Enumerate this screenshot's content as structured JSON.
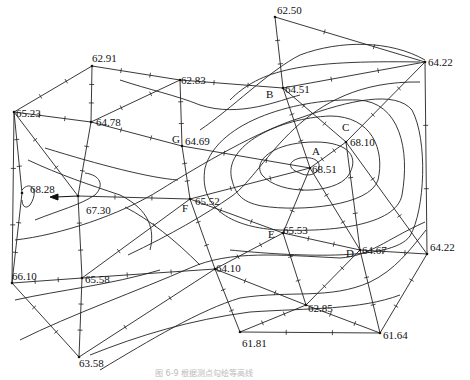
{
  "diagram": {
    "type": "contour-interpolation-map",
    "caption": "图 6-9  根据测点勾绘等高线",
    "points": [
      {
        "id": "p1",
        "label": "62.50",
        "x": 275,
        "y": 17,
        "lx": 277,
        "ly": 14
      },
      {
        "id": "p2",
        "label": "64.22",
        "x": 425,
        "y": 62,
        "lx": 428,
        "ly": 66
      },
      {
        "id": "p3",
        "label": "62.91",
        "x": 92,
        "y": 66,
        "lx": 92,
        "ly": 62
      },
      {
        "id": "p4",
        "label": "62.83",
        "x": 180,
        "y": 80,
        "lx": 181,
        "ly": 84
      },
      {
        "id": "p5",
        "label": "64.51",
        "x": 283,
        "y": 88,
        "lx": 285,
        "ly": 93
      },
      {
        "id": "p6",
        "label": "65.23",
        "x": 14,
        "y": 112,
        "lx": 16,
        "ly": 117
      },
      {
        "id": "p7",
        "label": "64.78",
        "x": 91,
        "y": 122,
        "lx": 96,
        "ly": 126
      },
      {
        "id": "p8",
        "label": "64.69",
        "x": 182,
        "y": 146,
        "lx": 185,
        "ly": 145
      },
      {
        "id": "p9",
        "label": "68.10",
        "x": 346,
        "y": 142,
        "lx": 350,
        "ly": 146
      },
      {
        "id": "p10",
        "label": "68.51",
        "x": 310,
        "y": 168,
        "lx": 312,
        "ly": 173
      },
      {
        "id": "p11",
        "label": "68.28",
        "x": 22,
        "y": 193,
        "lx": 30,
        "ly": 193
      },
      {
        "id": "p12",
        "label": "67.30",
        "x": 78,
        "y": 196,
        "lx": 86,
        "ly": 214
      },
      {
        "id": "p13",
        "label": "65.52",
        "x": 190,
        "y": 199,
        "lx": 195,
        "ly": 205
      },
      {
        "id": "p14",
        "label": "64.22",
        "x": 427,
        "y": 254,
        "lx": 430,
        "ly": 251
      },
      {
        "id": "p15",
        "label": "65.53",
        "x": 283,
        "y": 233,
        "lx": 283,
        "ly": 234
      },
      {
        "id": "p16",
        "label": "64.67",
        "x": 360,
        "y": 250,
        "lx": 362,
        "ly": 254
      },
      {
        "id": "p17",
        "label": "64.10",
        "x": 215,
        "y": 269,
        "lx": 216,
        "ly": 272
      },
      {
        "id": "p18",
        "label": "66.10",
        "x": 12,
        "y": 283,
        "lx": 12,
        "ly": 280
      },
      {
        "id": "p19",
        "label": "65.58",
        "x": 82,
        "y": 278,
        "lx": 85,
        "ly": 283
      },
      {
        "id": "p20",
        "label": "62.85",
        "x": 306,
        "y": 305,
        "lx": 308,
        "ly": 312
      },
      {
        "id": "p21",
        "label": "61.81",
        "x": 240,
        "y": 332,
        "lx": 242,
        "ly": 347
      },
      {
        "id": "p22",
        "label": "61.64",
        "x": 380,
        "y": 333,
        "lx": 383,
        "ly": 339
      },
      {
        "id": "p23",
        "label": "63.58",
        "x": 79,
        "y": 357,
        "lx": 79,
        "ly": 367
      }
    ],
    "letters": [
      {
        "label": "A",
        "x": 312,
        "y": 155
      },
      {
        "label": "B",
        "x": 266,
        "y": 98
      },
      {
        "label": "C",
        "x": 342,
        "y": 131
      },
      {
        "label": "D",
        "x": 346,
        "y": 257
      },
      {
        "label": "E",
        "x": 268,
        "y": 238
      },
      {
        "label": "F",
        "x": 182,
        "y": 212
      },
      {
        "label": "G",
        "x": 172,
        "y": 143
      }
    ],
    "edges": [
      [
        "p1",
        "p2"
      ],
      [
        "p1",
        "p5"
      ],
      [
        "p2",
        "p5"
      ],
      [
        "p2",
        "p14"
      ],
      [
        "p2",
        "p9"
      ],
      [
        "p3",
        "p4"
      ],
      [
        "p3",
        "p6"
      ],
      [
        "p3",
        "p7"
      ],
      [
        "p4",
        "p5"
      ],
      [
        "p4",
        "p7"
      ],
      [
        "p4",
        "p8"
      ],
      [
        "p5",
        "p9"
      ],
      [
        "p5",
        "p10"
      ],
      [
        "p6",
        "p7"
      ],
      [
        "p6",
        "p18"
      ],
      [
        "p6",
        "p12"
      ],
      [
        "p7",
        "p8"
      ],
      [
        "p7",
        "p12"
      ],
      [
        "p8",
        "p13"
      ],
      [
        "p8",
        "p10"
      ],
      [
        "p9",
        "p10"
      ],
      [
        "p9",
        "p14"
      ],
      [
        "p9",
        "p16"
      ],
      [
        "p10",
        "p13"
      ],
      [
        "p10",
        "p15"
      ],
      [
        "p10",
        "p16"
      ],
      [
        "p12",
        "p13"
      ],
      [
        "p12",
        "p19"
      ],
      [
        "p13",
        "p15"
      ],
      [
        "p13",
        "p17"
      ],
      [
        "p13",
        "p19"
      ],
      [
        "p14",
        "p16"
      ],
      [
        "p14",
        "p22"
      ],
      [
        "p15",
        "p16"
      ],
      [
        "p15",
        "p20"
      ],
      [
        "p15",
        "p17"
      ],
      [
        "p16",
        "p20"
      ],
      [
        "p16",
        "p22"
      ],
      [
        "p17",
        "p19"
      ],
      [
        "p17",
        "p20"
      ],
      [
        "p17",
        "p21"
      ],
      [
        "p17",
        "p23"
      ],
      [
        "p18",
        "p19"
      ],
      [
        "p18",
        "p23"
      ],
      [
        "p19",
        "p23"
      ],
      [
        "p20",
        "p22"
      ],
      [
        "p20",
        "p21"
      ],
      [
        "p21",
        "p22"
      ],
      [
        "p11",
        "p18"
      ],
      [
        "p11",
        "p6"
      ]
    ],
    "contours": [
      "M300,173 C290,170 285,162 300,158 C315,156 322,162 318,170 C314,176 305,176 300,173 Z",
      "M262,175 C252,160 275,142 315,142 C350,142 360,158 348,176 C335,194 280,196 262,175 Z",
      "M232,180 C222,145 280,118 330,116 C372,116 385,150 378,180 C370,206 300,212 262,206 C240,202 235,192 232,180 Z",
      "M205,168 C218,120 300,98 358,100 C400,102 410,150 402,195 C396,226 330,232 280,230 C235,228 198,210 205,168 Z",
      "M15,240 C60,235 120,215 160,190 C200,165 260,130 300,118 C350,100 395,90 412,110 C428,140 425,210 410,236 C392,262 290,256 230,250",
      "M128,255 C170,235 205,215 232,196 C268,170 300,80 420,82",
      "M20,340 C70,315 140,290 190,268 C230,250 280,255 340,258 C370,256 385,240 425,222",
      "M100,370 C150,340 200,310 240,298 C290,290 330,300 370,282 C395,270 410,250 426,230",
      "M90,355 C140,335 190,320 250,312 C310,308 360,310 400,295",
      "M45,148 C100,165 150,178 178,180",
      "M125,207 C150,220 175,240 200,265",
      "M15,300 C60,290 110,285 160,270",
      "M200,130 C230,110 270,70 300,55 C340,40 390,40 425,60",
      "M230,100 C260,70 300,60 420,62",
      "M120,80 C150,90 175,95 200,105 C240,118 280,100 300,95",
      "M28,160 C60,175 90,185 120,195 C150,210 155,230 150,250",
      "M35,220 C60,210 80,205 95,195 C105,185 100,175 85,173",
      "M22,190 C30,180 40,190 30,205 C25,210 22,205 22,200"
    ],
    "arrow": {
      "x1": 78,
      "y1": 196,
      "x2": 50,
      "y2": 197
    }
  }
}
